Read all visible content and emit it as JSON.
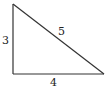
{
  "diagram": {
    "type": "right-triangle",
    "stroke_color": "#333333",
    "vertices": {
      "top": [
        13,
        4
      ],
      "right_angle": [
        13,
        74
      ],
      "bottom_right": [
        104,
        74
      ]
    },
    "labels": {
      "vertical_side": "3",
      "hypotenuse": "5",
      "horizontal_side": "4"
    }
  }
}
